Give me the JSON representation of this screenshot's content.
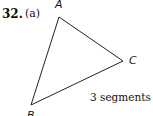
{
  "problem": {
    "number": "32.",
    "part": "(a)"
  },
  "diagram": {
    "vertices": [
      {
        "label": "A",
        "x": 59,
        "y": 17
      },
      {
        "label": "C",
        "x": 123,
        "y": 61
      },
      {
        "label": "B",
        "x": 31,
        "y": 105
      }
    ],
    "caption": "3 segments"
  }
}
